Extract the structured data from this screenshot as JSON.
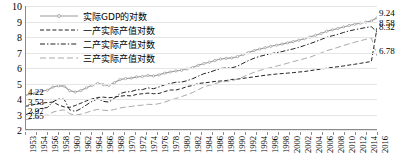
{
  "chart_data": {
    "type": "line",
    "title": "",
    "xlabel": "",
    "ylabel": "",
    "ylim": [
      2,
      10
    ],
    "yticks": [
      2,
      3,
      4,
      5,
      6,
      7,
      8,
      9,
      10
    ],
    "grid": true,
    "legend_position": "top-left",
    "x": [
      1953,
      1954,
      1955,
      1956,
      1957,
      1958,
      1959,
      1960,
      1961,
      1962,
      1963,
      1964,
      1965,
      1966,
      1967,
      1968,
      1969,
      1970,
      1971,
      1972,
      1973,
      1974,
      1975,
      1976,
      1977,
      1978,
      1979,
      1980,
      1981,
      1982,
      1983,
      1984,
      1985,
      1986,
      1987,
      1988,
      1989,
      1990,
      1991,
      1992,
      1993,
      1994,
      1995,
      1996,
      1997,
      1998,
      1999,
      2000,
      2001,
      2002,
      2003,
      2004,
      2005,
      2006,
      2007,
      2008,
      2009,
      2010,
      2011,
      2012,
      2013,
      2014,
      2015,
      2016
    ],
    "xticklabels": [
      "1953",
      "1954",
      "1956",
      "1958",
      "1960",
      "1962",
      "1964",
      "1966",
      "1968",
      "1970",
      "1972",
      "1974",
      "1976",
      "1978",
      "1980",
      "1982",
      "1984",
      "1986",
      "1988",
      "1990",
      "1992",
      "1994",
      "1996",
      "1998",
      "2000",
      "2002",
      "2004",
      "2006",
      "2008",
      "2010",
      "2012",
      "2014",
      "2016"
    ],
    "series": [
      {
        "name": "实际GDP的对数",
        "color": "#999999",
        "style": "solid-marker",
        "start_label": "4.22",
        "end_label": "9.24",
        "values": [
          4.22,
          4.33,
          4.4,
          4.52,
          4.56,
          4.77,
          4.85,
          4.83,
          4.54,
          4.45,
          4.55,
          4.72,
          4.88,
          5.0,
          4.93,
          4.88,
          5.05,
          5.25,
          5.32,
          5.35,
          5.43,
          5.45,
          5.52,
          5.49,
          5.56,
          5.67,
          5.74,
          5.81,
          5.85,
          5.93,
          6.03,
          6.17,
          6.29,
          6.37,
          6.48,
          6.58,
          6.62,
          6.65,
          6.73,
          6.87,
          7.0,
          7.12,
          7.22,
          7.31,
          7.4,
          7.47,
          7.54,
          7.62,
          7.7,
          7.79,
          7.89,
          8.0,
          8.11,
          8.23,
          8.37,
          8.46,
          8.55,
          8.65,
          8.74,
          8.82,
          8.89,
          8.96,
          9.03,
          9.24
        ]
      },
      {
        "name": "一产实际产值对数",
        "color": "#222222",
        "style": "dashed",
        "start_label": "3.53",
        "end_label": "8.58",
        "values": [
          3.53,
          3.58,
          3.68,
          3.74,
          3.77,
          3.8,
          3.62,
          3.49,
          3.46,
          3.58,
          3.73,
          3.88,
          4.0,
          4.1,
          4.12,
          4.08,
          4.12,
          4.18,
          4.22,
          4.2,
          4.3,
          4.34,
          4.38,
          4.34,
          4.36,
          4.48,
          4.58,
          4.58,
          4.67,
          4.8,
          4.87,
          5.0,
          5.04,
          5.08,
          5.13,
          5.16,
          5.19,
          5.26,
          5.28,
          5.33,
          5.38,
          5.43,
          5.48,
          5.53,
          5.57,
          5.61,
          5.64,
          5.67,
          5.7,
          5.74,
          5.77,
          5.83,
          5.88,
          5.93,
          5.99,
          6.04,
          6.08,
          6.13,
          6.19,
          6.24,
          6.3,
          6.36,
          6.42,
          8.58
        ]
      },
      {
        "name": "二产实际产值对数",
        "color": "#222222",
        "style": "dashdot",
        "start_label": "2.97",
        "end_label": "8.32",
        "values": [
          2.97,
          3.12,
          3.18,
          3.4,
          3.45,
          3.82,
          4.0,
          3.98,
          3.3,
          3.2,
          3.38,
          3.62,
          3.85,
          4.02,
          3.85,
          3.8,
          4.05,
          4.35,
          4.45,
          4.48,
          4.6,
          4.6,
          4.72,
          4.66,
          4.78,
          4.92,
          5.0,
          5.08,
          5.09,
          5.18,
          5.31,
          5.47,
          5.63,
          5.72,
          5.85,
          5.97,
          6.0,
          6.01,
          6.11,
          6.3,
          6.48,
          6.63,
          6.75,
          6.84,
          6.92,
          6.99,
          7.06,
          7.15,
          7.23,
          7.33,
          7.45,
          7.57,
          7.7,
          7.84,
          7.98,
          8.08,
          8.17,
          8.29,
          8.39,
          8.47,
          8.54,
          8.61,
          8.66,
          8.32
        ]
      },
      {
        "name": "三产实际产值对数",
        "color": "#aaaaaa",
        "style": "longdash",
        "start_label": "2.65",
        "end_label": "6.78",
        "values": [
          2.65,
          2.72,
          2.78,
          2.92,
          2.96,
          3.15,
          3.25,
          3.3,
          3.05,
          2.95,
          3.02,
          3.12,
          3.25,
          3.33,
          3.28,
          3.25,
          3.32,
          3.42,
          3.48,
          3.52,
          3.58,
          3.6,
          3.66,
          3.64,
          3.7,
          3.8,
          3.92,
          4.03,
          4.15,
          4.28,
          4.42,
          4.6,
          4.78,
          4.88,
          4.98,
          5.1,
          5.13,
          5.18,
          5.28,
          5.42,
          5.58,
          5.72,
          5.84,
          5.94,
          6.03,
          6.12,
          6.21,
          6.31,
          6.41,
          6.51,
          6.6,
          6.7,
          6.83,
          6.97,
          7.12,
          7.22,
          7.33,
          7.45,
          7.56,
          7.66,
          7.76,
          7.85,
          7.94,
          6.78
        ]
      }
    ],
    "start_annotations": [
      "4.22",
      "3.53",
      "2.97",
      "2.65"
    ],
    "end_annotations": [
      "9.24",
      "8.58",
      "8.32",
      "6.78"
    ]
  }
}
